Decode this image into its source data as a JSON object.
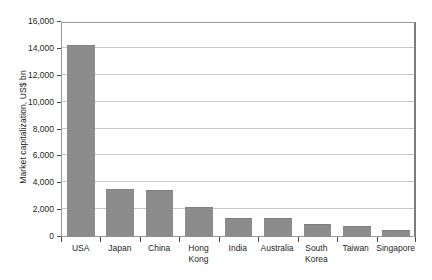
{
  "chart_data": {
    "type": "bar",
    "title": "",
    "xlabel": "",
    "ylabel": "Market capitalization, US$ bn",
    "categories": [
      "USA",
      "Japan",
      "China",
      "Hong Kong",
      "India",
      "Australia",
      "South Korea",
      "Taiwan",
      "Singapore"
    ],
    "values": [
      14300,
      3600,
      3500,
      2250,
      1450,
      1400,
      950,
      850,
      500
    ],
    "ylim": [
      0,
      16000
    ],
    "yticks": [
      0,
      2000,
      4000,
      6000,
      8000,
      10000,
      12000,
      14000,
      16000
    ],
    "ytick_labels": [
      "0",
      "2,000",
      "4,000",
      "6,000",
      "8,000",
      "10,000",
      "12,000",
      "14,000",
      "16,000"
    ],
    "grid": true,
    "legend": false,
    "bar_color": "#8c8c8c",
    "grid_color": "#c9c9c9",
    "axis_color": "#4a4a4a",
    "text_color": "#231f20",
    "background": "#ffffff"
  }
}
